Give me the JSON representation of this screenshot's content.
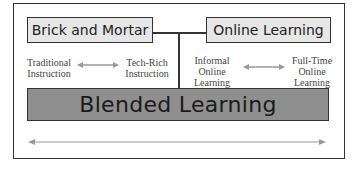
{
  "diagram": {
    "colors": {
      "top_box_fill": "#e6e6e6",
      "blended_fill": "#8f8f8f",
      "border": "#333333",
      "arrow": "#9a9a9a"
    },
    "boxes": {
      "brick_and_mortar": "Brick and Mortar",
      "online_learning": "Online Learning",
      "blended_learning": "Blended Learning"
    },
    "left_spectrum": {
      "start_line1": "Traditional",
      "start_line2": "Instruction",
      "end_line1": "Tech-Rich",
      "end_line2": "Instruction"
    },
    "right_spectrum": {
      "start_line1": "Informal",
      "start_line2": "Online",
      "start_line3": "Learning",
      "end_line1": "Full-Time",
      "end_line2": "Online",
      "end_line3": "Learning"
    }
  }
}
